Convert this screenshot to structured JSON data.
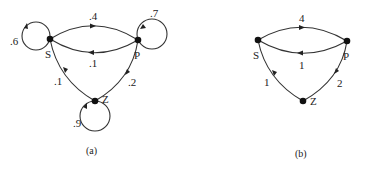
{
  "diagrams": [
    {
      "caption": "(a)",
      "nodes": [
        {
          "id": "S",
          "label": "S"
        },
        {
          "id": "P",
          "label": "P"
        },
        {
          "id": "Z",
          "label": "Z"
        }
      ],
      "edges": [
        {
          "from": "S",
          "to": "S",
          "label": ".6"
        },
        {
          "from": "S",
          "to": "P",
          "label": ".4"
        },
        {
          "from": "P",
          "to": "S",
          "label": ".1"
        },
        {
          "from": "P",
          "to": "P",
          "label": ".7"
        },
        {
          "from": "P",
          "to": "Z",
          "label": ".2"
        },
        {
          "from": "Z",
          "to": "S",
          "label": ".1"
        },
        {
          "from": "Z",
          "to": "Z",
          "label": ".9"
        }
      ]
    },
    {
      "caption": "(b)",
      "nodes": [
        {
          "id": "S",
          "label": "S"
        },
        {
          "id": "P",
          "label": "P"
        },
        {
          "id": "Z",
          "label": "Z"
        }
      ],
      "edges": [
        {
          "from": "S",
          "to": "P",
          "label": "4"
        },
        {
          "from": "P",
          "to": "S",
          "label": "1"
        },
        {
          "from": "P",
          "to": "Z",
          "label": "2"
        },
        {
          "from": "Z",
          "to": "S",
          "label": "1"
        }
      ]
    }
  ]
}
